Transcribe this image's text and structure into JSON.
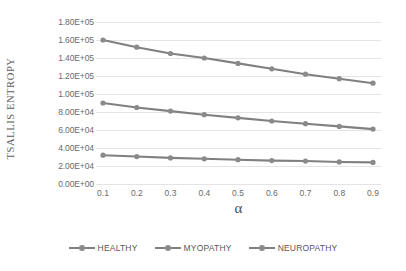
{
  "chart_data": {
    "type": "line",
    "title": "",
    "xlabel": "α",
    "ylabel": "TSALLIS ENTROPY",
    "x": [
      0.1,
      0.2,
      0.3,
      0.4,
      0.5,
      0.6,
      0.7,
      0.8,
      0.9
    ],
    "categories": [
      "0.1",
      "0.2",
      "0.3",
      "0.4",
      "0.5",
      "0.6",
      "0.7",
      "0.8",
      "0.9"
    ],
    "ylim": [
      0,
      180000
    ],
    "ytick_values": [
      0,
      20000,
      40000,
      60000,
      80000,
      100000,
      120000,
      140000,
      160000,
      180000
    ],
    "ytick_labels": [
      "0.00E+00",
      "2.00E+04",
      "4.00E+04",
      "6.00E+04",
      "8.00E+04",
      "1.00E+05",
      "1.20E+05",
      "1.40E+05",
      "1.60E+05",
      "1.80E+05"
    ],
    "grid": true,
    "legend_position": "bottom",
    "series": [
      {
        "name": "HEALTHY",
        "color": "#8a8a8a",
        "values": [
          32000,
          30500,
          29000,
          28000,
          27000,
          26000,
          25500,
          24500,
          24000
        ]
      },
      {
        "name": "MYOPATHY",
        "color": "#8a8a8a",
        "values": [
          90000,
          85000,
          81000,
          77000,
          73500,
          70000,
          67000,
          64000,
          61000
        ]
      },
      {
        "name": "NEUROPATHY",
        "color": "#8a8a8a",
        "values": [
          160000,
          152000,
          145000,
          140000,
          134000,
          128000,
          122000,
          117000,
          112000
        ]
      }
    ]
  },
  "legend": {
    "items": [
      {
        "label": "HEALTHY"
      },
      {
        "label": "MYOPATHY"
      },
      {
        "label": "NEUROPATHY"
      }
    ]
  },
  "axes": {
    "y_title": "TSALLIS ENTROPY",
    "x_title": "α"
  },
  "colors": {
    "series_line": "#808080",
    "series_marker": "#8a8a8a",
    "gridline": "#e4e4e4",
    "tick_text": "#6b6b6b",
    "axis_title": "#5d5d5d",
    "background": "#ffffff"
  }
}
